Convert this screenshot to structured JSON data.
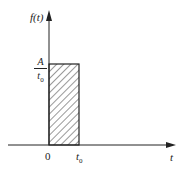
{
  "diagram": {
    "y_axis_label": "f(t)",
    "x_axis_label": "t",
    "height_label": {
      "numerator": "A",
      "denominator_var": "t",
      "denominator_sub": "0"
    },
    "x_ticks": [
      {
        "label": "0"
      },
      {
        "var": "t",
        "sub": "0"
      }
    ],
    "region": {
      "fill": "diagonal hatching",
      "x_from": "0",
      "x_to": "t0",
      "height": "A/t0"
    },
    "colors": {
      "stroke": "#222222",
      "background": "#ffffff"
    }
  }
}
